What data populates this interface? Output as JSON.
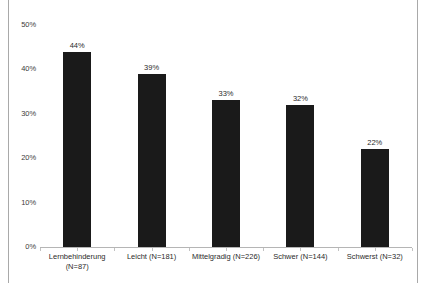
{
  "chart_data": {
    "type": "bar",
    "title": "",
    "subtitle": "",
    "xlabel": "",
    "ylabel": "",
    "ylim": [
      0,
      50
    ],
    "yticks": [
      "0%",
      "10%",
      "20%",
      "30%",
      "40%",
      "50%"
    ],
    "ytick_values": [
      0,
      10,
      20,
      30,
      40,
      50
    ],
    "grid": false,
    "legend": null,
    "categories": [
      "Lernbehinderung\n(N=87)",
      "Leicht (N=181)",
      "Mittelgradig (N=226)",
      "Schwer (N=144)",
      "Schwerst (N=32)"
    ],
    "values": [
      44,
      39,
      33,
      32,
      22
    ],
    "value_labels": [
      "44%",
      "39%",
      "33%",
      "32%",
      "22%"
    ],
    "bar_color": "#1a1a1a",
    "background_color": "#ffffff",
    "axis_color": "#b5b5b5",
    "frame_color": "#a9a9a9"
  }
}
